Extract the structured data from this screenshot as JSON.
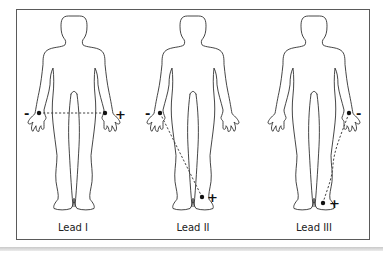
{
  "figure": {
    "panels": [
      {
        "id": "lead-1",
        "caption": "Lead I",
        "negative": {
          "sign": "-",
          "location": "right arm"
        },
        "positive": {
          "sign": "+",
          "location": "left arm"
        }
      },
      {
        "id": "lead-2",
        "caption": "Lead II",
        "negative": {
          "sign": "-",
          "location": "right arm"
        },
        "positive": {
          "sign": "+",
          "location": "left leg"
        }
      },
      {
        "id": "lead-3",
        "caption": "Lead III",
        "negative": {
          "sign": "-",
          "location": "left arm"
        },
        "positive": {
          "sign": "+",
          "location": "left leg"
        }
      }
    ]
  },
  "colors": {
    "outline": "#2a2a2a",
    "frame": "#5a5a5a",
    "electrode": "#111111"
  }
}
